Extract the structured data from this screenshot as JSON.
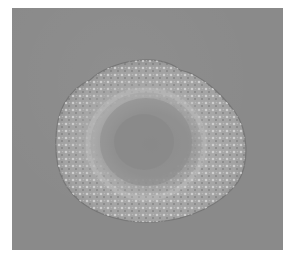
{
  "image": {
    "subject": "microscopy image of a round cell/embryo with granular textured periphery and smoother central region",
    "background_color": "#8a8a8a",
    "border_color": "#ffffff",
    "cell_outer_color": "#a8a8a8",
    "cell_highlight_color": "#d8d8d8",
    "cell_center_color": "#8c8c8c"
  }
}
